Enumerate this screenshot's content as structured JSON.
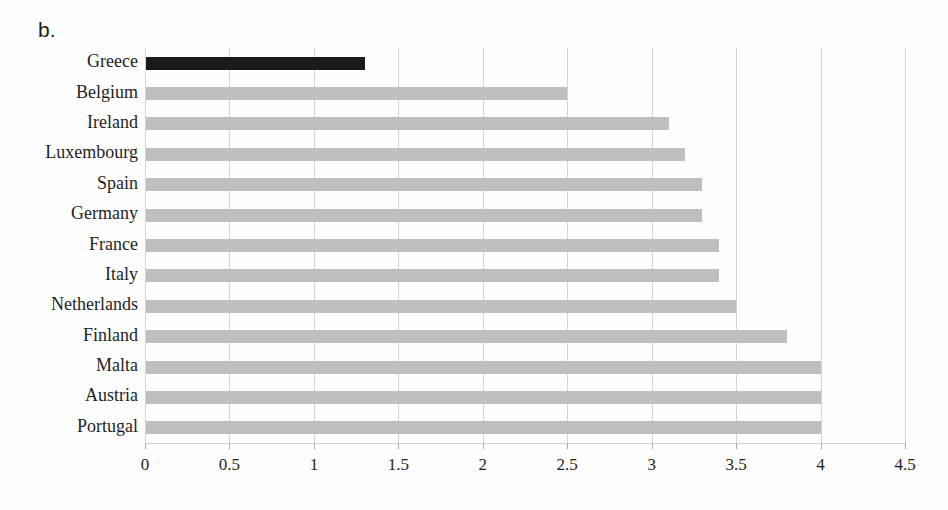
{
  "figure_label": "b.",
  "chart_data": {
    "type": "bar",
    "orientation": "horizontal",
    "categories": [
      "Greece",
      "Belgium",
      "Ireland",
      "Luxembourg",
      "Spain",
      "Germany",
      "France",
      "Italy",
      "Netherlands",
      "Finland",
      "Malta",
      "Austria",
      "Portugal"
    ],
    "values": [
      1.3,
      2.5,
      3.1,
      3.2,
      3.3,
      3.3,
      3.4,
      3.4,
      3.5,
      3.8,
      4.0,
      4.0,
      4.0
    ],
    "highlight_category": "Greece",
    "highlight_color": "#1a1a1a",
    "bar_color": "#bfbfbf",
    "gridline_color": "#d4d4d4",
    "x_ticks": [
      "0",
      "0.5",
      "1",
      "1.5",
      "2",
      "2.5",
      "3",
      "3.5",
      "4",
      "4.5"
    ],
    "x_tick_values": [
      0,
      0.5,
      1,
      1.5,
      2,
      2.5,
      3,
      3.5,
      4,
      4.5
    ],
    "xlim": [
      0,
      4.5
    ],
    "grid": "vertical"
  }
}
